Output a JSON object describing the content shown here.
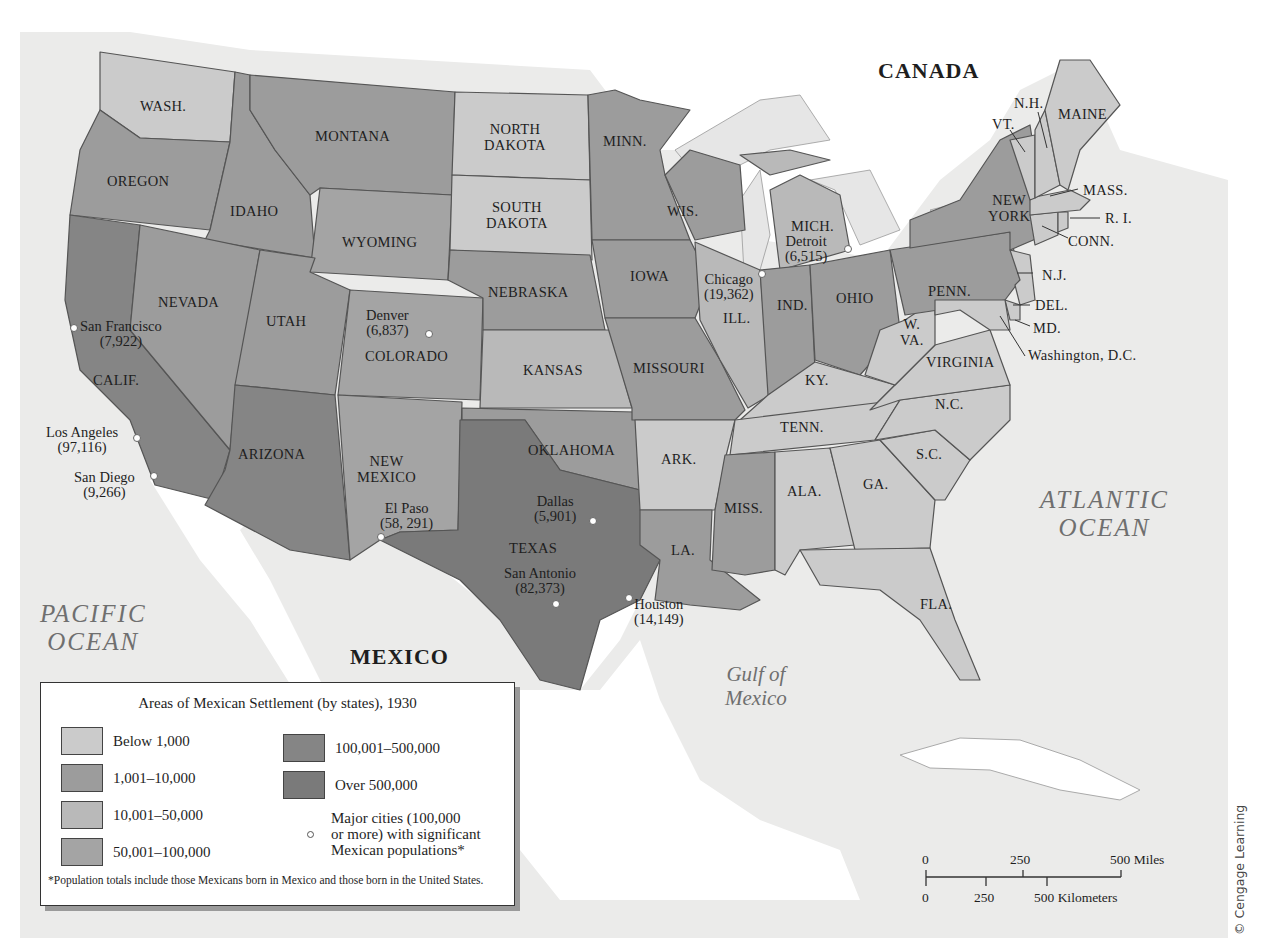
{
  "map": {
    "title": "Areas of Mexican Settlement (by states), 1930",
    "countries": {
      "canada": "CANADA",
      "mexico": "MEXICO"
    },
    "water": {
      "pacific": [
        "PACIFIC",
        "OCEAN"
      ],
      "atlantic": [
        "ATLANTIC",
        "OCEAN"
      ],
      "gulf": [
        "Gulf of",
        "Mexico"
      ]
    },
    "colors": {
      "below_1000": "#cbcbcb",
      "1001_10000": "#9c9c9c",
      "10001_50000": "#b9b9b9",
      "50001_100000": "#a4a4a4",
      "100001_500000": "#858585",
      "over_500000": "#7a7a7a",
      "ocean": "#ebebea",
      "land_foreign": "#ffffff"
    },
    "states": [
      {
        "label": "WASH.",
        "category": "below_1000"
      },
      {
        "label": "OREGON",
        "category": "1001_10000"
      },
      {
        "label": "CALIF.",
        "category": "100001_500000"
      },
      {
        "label": "IDAHO",
        "category": "1001_10000"
      },
      {
        "label": "NEVADA",
        "category": "1001_10000"
      },
      {
        "label": "MONTANA",
        "category": "1001_10000"
      },
      {
        "label": "WYOMING",
        "category": "1001_10000"
      },
      {
        "label": "UTAH",
        "category": "1001_10000"
      },
      {
        "label": "ARIZONA",
        "category": "100001_500000"
      },
      {
        "label": "COLORADO",
        "category": "50001_100000"
      },
      {
        "label": "NEW MEXICO",
        "category": "50001_100000"
      },
      {
        "label": "NORTH DAKOTA",
        "category": "below_1000"
      },
      {
        "label": "SOUTH DAKOTA",
        "category": "below_1000"
      },
      {
        "label": "NEBRASKA",
        "category": "1001_10000"
      },
      {
        "label": "KANSAS",
        "category": "10001_50000"
      },
      {
        "label": "OKLAHOMA",
        "category": "1001_10000"
      },
      {
        "label": "TEXAS",
        "category": "over_500000"
      },
      {
        "label": "MINN.",
        "category": "1001_10000"
      },
      {
        "label": "IOWA",
        "category": "1001_10000"
      },
      {
        "label": "MISSOURI",
        "category": "1001_10000"
      },
      {
        "label": "ARK.",
        "category": "below_1000"
      },
      {
        "label": "LA.",
        "category": "1001_10000"
      },
      {
        "label": "WIS.",
        "category": "1001_10000"
      },
      {
        "label": "ILL.",
        "category": "10001_50000"
      },
      {
        "label": "MICH.",
        "category": "10001_50000"
      },
      {
        "label": "IND.",
        "category": "1001_10000"
      },
      {
        "label": "OHIO",
        "category": "1001_10000"
      },
      {
        "label": "KY.",
        "category": "below_1000"
      },
      {
        "label": "TENN.",
        "category": "below_1000"
      },
      {
        "label": "MISS.",
        "category": "1001_10000"
      },
      {
        "label": "ALA.",
        "category": "below_1000"
      },
      {
        "label": "GA.",
        "category": "below_1000"
      },
      {
        "label": "FLA.",
        "category": "below_1000"
      },
      {
        "label": "S.C.",
        "category": "below_1000"
      },
      {
        "label": "N.C.",
        "category": "below_1000"
      },
      {
        "label": "VIRGINIA",
        "category": "below_1000"
      },
      {
        "label": "W. VA.",
        "category": "below_1000"
      },
      {
        "label": "PENN.",
        "category": "1001_10000"
      },
      {
        "label": "NEW YORK",
        "category": "1001_10000"
      },
      {
        "label": "N.J.",
        "category": "below_1000"
      },
      {
        "label": "DEL.",
        "category": "below_1000"
      },
      {
        "label": "MD.",
        "category": "below_1000"
      },
      {
        "label": "CONN.",
        "category": "below_1000"
      },
      {
        "label": "R. I.",
        "category": "below_1000"
      },
      {
        "label": "MASS.",
        "category": "below_1000"
      },
      {
        "label": "VT.",
        "category": "below_1000"
      },
      {
        "label": "N.H.",
        "category": "below_1000"
      },
      {
        "label": "MAINE",
        "category": "below_1000"
      }
    ],
    "state_labels": {
      "wash": "WASH.",
      "oregon": "OREGON",
      "calif": "CALIF.",
      "idaho": "IDAHO",
      "nevada": "NEVADA",
      "montana": "MONTANA",
      "wyoming": "WYOMING",
      "utah": "UTAH",
      "arizona": "ARIZONA",
      "colorado": "COLORADO",
      "new_mexico_1": "NEW",
      "new_mexico_2": "MEXICO",
      "north_dakota_1": "NORTH",
      "north_dakota_2": "DAKOTA",
      "south_dakota_1": "SOUTH",
      "south_dakota_2": "DAKOTA",
      "nebraska": "NEBRASKA",
      "kansas": "KANSAS",
      "oklahoma": "OKLAHOMA",
      "texas": "TEXAS",
      "minn": "MINN.",
      "iowa": "IOWA",
      "missouri": "MISSOURI",
      "ark": "ARK.",
      "la": "LA.",
      "wis": "WIS.",
      "ill": "ILL.",
      "mich": "MICH.",
      "ind": "IND.",
      "ohio": "OHIO",
      "ky": "KY.",
      "tenn": "TENN.",
      "miss": "MISS.",
      "ala": "ALA.",
      "ga": "GA.",
      "fla": "FLA.",
      "sc": "S.C.",
      "nc": "N.C.",
      "virginia": "VIRGINIA",
      "wva_1": "W.",
      "wva_2": "VA.",
      "penn": "PENN.",
      "new_york_1": "NEW",
      "new_york_2": "YORK",
      "nj": "N.J.",
      "del": "DEL.",
      "md": "MD.",
      "dc": "Washington, D.C.",
      "conn": "CONN.",
      "ri": "R. I.",
      "mass": "MASS.",
      "vt": "VT.",
      "nh": "N.H.",
      "maine": "MAINE"
    },
    "cities": [
      {
        "name": "San Francisco",
        "population": "(7,922)"
      },
      {
        "name": "Los Angeles",
        "population": "(97,116)"
      },
      {
        "name": "San Diego",
        "population": "(9,266)"
      },
      {
        "name": "Denver",
        "population": "(6,837)"
      },
      {
        "name": "El Paso",
        "population": "(58, 291)"
      },
      {
        "name": "Dallas",
        "population": "(5,901)"
      },
      {
        "name": "San Antonio",
        "population": "(82,373)"
      },
      {
        "name": "Houston",
        "population": "(14,149)"
      },
      {
        "name": "Chicago",
        "population": "(19,362)"
      },
      {
        "name": "Detroit",
        "population": "(6,515)"
      }
    ]
  },
  "legend": {
    "title": "Areas of Mexican Settlement (by states), 1930",
    "items": [
      {
        "label": "Below 1,000",
        "color": "#cbcbcb"
      },
      {
        "label": "1,001–10,000",
        "color": "#9c9c9c"
      },
      {
        "label": "10,001–50,000",
        "color": "#b9b9b9"
      },
      {
        "label": "50,001–100,000",
        "color": "#a4a4a4"
      },
      {
        "label": "100,001–500,000",
        "color": "#858585"
      },
      {
        "label": "Over 500,000",
        "color": "#7a7a7a"
      }
    ],
    "city_key": [
      "Major cities (100,000",
      "or more) with significant",
      "Mexican populations*"
    ],
    "footnote": "*Population totals include those Mexicans born in Mexico and those born in the United States."
  },
  "scale_bar": {
    "miles": [
      "0",
      "250",
      "500 Miles"
    ],
    "kilometers": [
      "0",
      "250",
      "500 Kilometers"
    ]
  },
  "credit": "© Cengage Learning"
}
